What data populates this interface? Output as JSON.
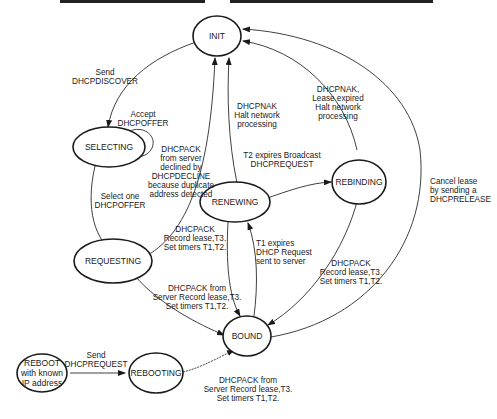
{
  "diagram": {
    "nodes": {
      "init": {
        "label": "INIT"
      },
      "selecting": {
        "label": "SELECTING"
      },
      "requesting": {
        "label": "REQUESTING"
      },
      "renewing": {
        "label": "RENEWING"
      },
      "rebinding": {
        "label": "REBINDING"
      },
      "bound": {
        "label": "BOUND"
      },
      "rebooting": {
        "label": "REBOOTING"
      },
      "reboot": {
        "lines": [
          "REBOOT",
          "with known",
          "IP address"
        ]
      }
    },
    "edges": {
      "init_selecting": {
        "lines": [
          "Send",
          "DHCPDISCOVER"
        ]
      },
      "selecting_self": {
        "lines": [
          "Accept",
          "DHCPOFFER"
        ]
      },
      "selecting_requesting": {
        "lines": [
          "Select one",
          "DHCPOFFER"
        ]
      },
      "requesting_init": {
        "lines": [
          "DHCPACK",
          "from server",
          "declined by",
          "DHCPDECLINE",
          "because duplicate",
          "address detected"
        ]
      },
      "renewing_init": {
        "lines": [
          "DHCPNAK",
          "Halt network",
          "processing"
        ]
      },
      "rebinding_init": {
        "lines": [
          "DHCPNAK,",
          "Lease expired",
          "Halt network",
          "processing"
        ]
      },
      "renewing_rebinding": {
        "lines": [
          "T2 expires Broadcast",
          "DHCPREQUEST"
        ]
      },
      "renewing_bound": {
        "lines": [
          "DHCPACK",
          "Record lease,T3.",
          "Set timers T1,T2."
        ]
      },
      "bound_renewing": {
        "lines": [
          "T1 expires",
          "DHCP Request",
          "sent to server"
        ]
      },
      "rebinding_bound": {
        "lines": [
          "DHCPACK",
          "Record lease,T3.",
          "Set timers T1,T2."
        ]
      },
      "bound_init": {
        "lines": [
          "Cancel lease",
          "by sending a",
          "DHCPRELEASE"
        ]
      },
      "requesting_bound": {
        "lines": [
          "DHCPACK from",
          "Server Record lease,T3.",
          "Set timers T1,T2."
        ]
      },
      "reboot_rebooting": {
        "lines": [
          "Send",
          "DHCPREQUEST"
        ]
      },
      "rebooting_bound": {
        "lines": [
          "DHCPACK from",
          "Server Record lease,T3.",
          "Set timers T1,T2."
        ]
      }
    }
  }
}
